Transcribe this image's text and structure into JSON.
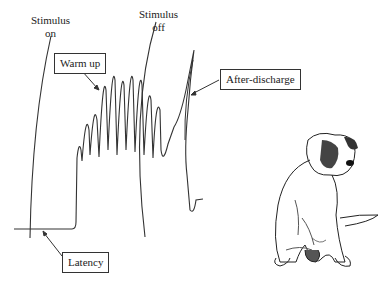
{
  "figure": {
    "labels": {
      "stimulus_on_line1": "Stimulus",
      "stimulus_on_line2": "on",
      "stimulus_off_line1": "Stimulus",
      "stimulus_off_line2": "off"
    },
    "callouts": {
      "warm_up": "Warm up",
      "after_discharge": "After-discharge",
      "latency": "Latency"
    },
    "colors": {
      "trace": "#333333",
      "background": "#ffffff"
    },
    "illustration": "dog-sitting-scratching"
  }
}
